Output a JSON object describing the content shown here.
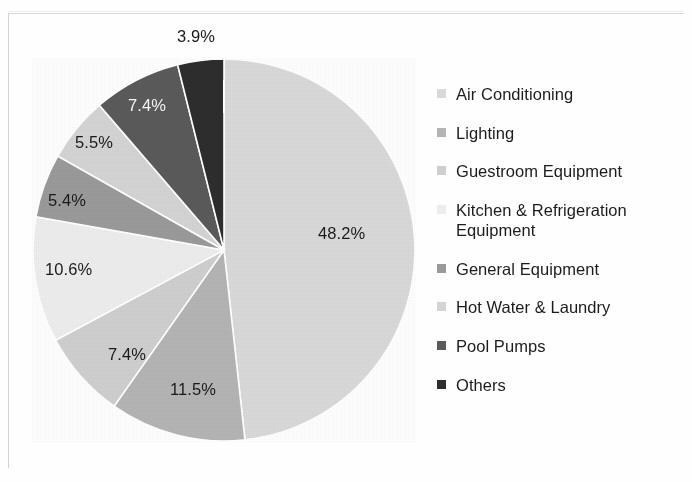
{
  "chart_data": {
    "type": "pie",
    "title": "",
    "subtitle": "",
    "xlabel": "",
    "ylabel": "",
    "legend_position": "right",
    "grid": false,
    "units": "percent",
    "start_angle_deg": 0,
    "direction": "clockwise",
    "categories": [
      "Air Conditioning",
      "Lighting",
      "Guestroom Equipment",
      "Kitchen & Refrigeration Equipment",
      "General Equipment",
      "Hot Water & Laundry",
      "Pool Pumps",
      "Others"
    ],
    "values": [
      48.2,
      11.5,
      7.4,
      10.6,
      5.4,
      5.5,
      7.4,
      3.9
    ],
    "data_labels": [
      "48.2%",
      "11.5%",
      "7.4%",
      "10.6%",
      "5.4%",
      "5.5%",
      "7.4%",
      "3.9%"
    ],
    "colors": [
      "#d9d9d9",
      "#b4b4b4",
      "#cfcfcf",
      "#ededed",
      "#9a9a9a",
      "#d4d4d4",
      "#5a5a5a",
      "#2d2d2d"
    ],
    "slice_label_colors": [
      "#1a1a1a",
      "#1a1a1a",
      "#1a1a1a",
      "#1a1a1a",
      "#1a1a1a",
      "#1a1a1a",
      "#f4f4f4",
      "#1a1a1a"
    ]
  },
  "legend": {
    "items": [
      {
        "label": "Air Conditioning",
        "color": "#d9d9d9",
        "value": 48.2,
        "data_label": "48.2%"
      },
      {
        "label": "Lighting",
        "color": "#b4b4b4",
        "value": 11.5,
        "data_label": "11.5%"
      },
      {
        "label": "Guestroom Equipment",
        "color": "#cfcfcf",
        "value": 7.4,
        "data_label": "7.4%"
      },
      {
        "label": "Kitchen & Refrigeration Equipment",
        "color": "#ededed",
        "value": 10.6,
        "data_label": "10.6%"
      },
      {
        "label": "General Equipment",
        "color": "#9a9a9a",
        "value": 5.4,
        "data_label": "5.4%"
      },
      {
        "label": "Hot Water & Laundry",
        "color": "#d4d4d4",
        "value": 5.5,
        "data_label": "5.5%"
      },
      {
        "label": "Pool Pumps",
        "color": "#5a5a5a",
        "value": 7.4,
        "data_label": "7.4%"
      },
      {
        "label": "Others",
        "color": "#2d2d2d",
        "value": 3.9,
        "data_label": "3.9%"
      }
    ]
  },
  "slice_labels": [
    {
      "text": "48.2%",
      "x": 318,
      "y": 224,
      "on_dark": false
    },
    {
      "text": "11.5%",
      "x": 170,
      "y": 380,
      "on_dark": false
    },
    {
      "text": "7.4%",
      "x": 108,
      "y": 345,
      "on_dark": false
    },
    {
      "text": "10.6%",
      "x": 45,
      "y": 260,
      "on_dark": false
    },
    {
      "text": "5.4%",
      "x": 48,
      "y": 191,
      "on_dark": false
    },
    {
      "text": "5.5%",
      "x": 75,
      "y": 133,
      "on_dark": false
    },
    {
      "text": "7.4%",
      "x": 128,
      "y": 96,
      "on_dark": true
    },
    {
      "text": "3.9%",
      "x": 177,
      "y": 27,
      "on_dark": false
    }
  ]
}
